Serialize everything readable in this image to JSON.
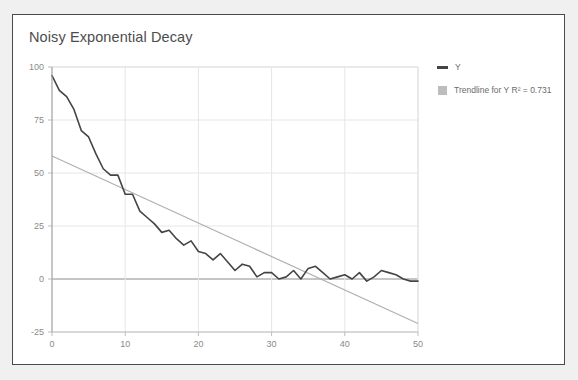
{
  "card": {
    "background": "#ffffff",
    "border_color": "#4a4a4a"
  },
  "chart_data": {
    "type": "line",
    "title": "Noisy Exponential Decay",
    "xlabel": "",
    "ylabel": "",
    "xlim": [
      0,
      50
    ],
    "ylim": [
      -25,
      100
    ],
    "xticks": [
      0,
      10,
      20,
      30,
      40,
      50
    ],
    "yticks": [
      -25,
      0,
      25,
      50,
      75,
      100
    ],
    "grid": true,
    "legend_position": "right",
    "series_color": "#444444",
    "trendline_color": "#b0b0b0",
    "legend": [
      {
        "label": "Y",
        "marker": "line",
        "color": "#444444"
      },
      {
        "label": "Trendline for Y R² = 0.731",
        "marker": "square",
        "color": "#bdbdbd"
      }
    ],
    "series": [
      {
        "name": "Y",
        "x": [
          0,
          1,
          2,
          3,
          4,
          5,
          6,
          7,
          8,
          9,
          10,
          11,
          12,
          13,
          14,
          15,
          16,
          17,
          18,
          19,
          20,
          21,
          22,
          23,
          24,
          25,
          26,
          27,
          28,
          29,
          30,
          31,
          32,
          33,
          34,
          35,
          36,
          37,
          38,
          39,
          40,
          41,
          42,
          43,
          44,
          45,
          46,
          47,
          48,
          49,
          50
        ],
        "values": [
          96,
          89,
          86,
          80,
          70,
          67,
          59,
          52,
          49,
          49,
          40,
          40,
          32,
          29,
          26,
          22,
          23,
          19,
          16,
          18,
          13,
          12,
          9,
          12,
          8,
          4,
          7,
          6,
          1,
          3,
          3,
          0,
          1,
          4,
          0,
          5,
          6,
          3,
          0,
          1,
          2,
          0,
          3,
          -1,
          1,
          4,
          3,
          2,
          0,
          -1,
          -1
        ]
      },
      {
        "name": "Trendline for Y",
        "type": "linear",
        "r_squared": 0.731,
        "x": [
          0,
          50
        ],
        "values": [
          58,
          -21
        ]
      }
    ]
  }
}
